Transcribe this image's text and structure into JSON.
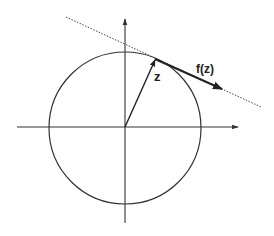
{
  "diagram": {
    "type": "complex-plane-vector-field",
    "labels": {
      "z": "z",
      "fz": "f(z)"
    },
    "colors": {
      "stroke": "#333333",
      "background": "#ffffff"
    },
    "geometry": {
      "origin": [
        125,
        127
      ],
      "circle_radius": 76,
      "x_axis": {
        "from": [
          17,
          127
        ],
        "to": [
          238,
          127
        ]
      },
      "y_axis": {
        "from": [
          125,
          223
        ],
        "to": [
          125,
          19
        ]
      },
      "z_vector": {
        "from": [
          125,
          127
        ],
        "to": [
          155,
          59
        ]
      },
      "fz_vector": {
        "from": [
          155,
          59
        ],
        "to": [
          222,
          89
        ]
      },
      "tangent_line": {
        "from": [
          66,
          17
        ],
        "to": [
          261,
          107
        ]
      }
    }
  }
}
